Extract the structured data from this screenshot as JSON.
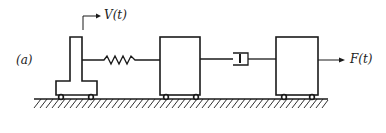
{
  "diagram": {
    "panel_label": "(a)",
    "input_label": "V(t)",
    "force_label": "F(t)",
    "components": [
      {
        "name": "driven-cart",
        "type": "T-shaped mass with wheels"
      },
      {
        "name": "spring",
        "type": "spring"
      },
      {
        "name": "middle-mass",
        "type": "mass with wheels"
      },
      {
        "name": "dashpot",
        "type": "damper"
      },
      {
        "name": "right-mass",
        "type": "mass with wheels"
      }
    ],
    "stroke_color": "#1a1a1a",
    "background": "#ffffff"
  }
}
